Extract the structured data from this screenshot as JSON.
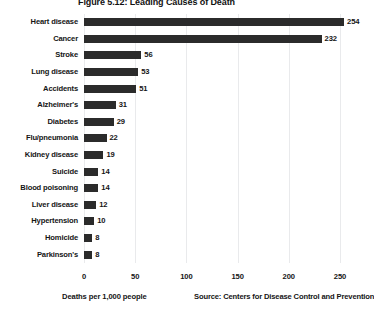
{
  "chart_data": {
    "type": "bar",
    "orientation": "horizontal",
    "title": "Figure 5.12: Leading Causes of Death",
    "xlabel": "Deaths per 1,000 people",
    "ylabel": "",
    "source": "Source: Centers for Disease Control and Prevention",
    "categories": [
      "Heart disease",
      "Cancer",
      "Stroke",
      "Lung disease",
      "Accidents",
      "Alzheimer's",
      "Diabetes",
      "Flu/pneumonia",
      "Kidney disease",
      "Suicide",
      "Blood poisoning",
      "Liver disease",
      "Hypertension",
      "Homicide",
      "Parkinson's"
    ],
    "values": [
      254,
      232,
      56,
      53,
      51,
      31,
      29,
      22,
      19,
      14,
      14,
      12,
      10,
      8,
      8
    ],
    "xlim": [
      0,
      250
    ],
    "xticks": [
      0,
      50,
      100,
      150,
      200,
      250
    ],
    "xtick_labels": [
      "0",
      "50",
      "100",
      "150",
      "200",
      "250"
    ],
    "grid": "vertical",
    "legend": "none",
    "bar_color": "#2b2b2b",
    "background_color": "#ffffff",
    "gridline_color": "#e9eaec"
  }
}
